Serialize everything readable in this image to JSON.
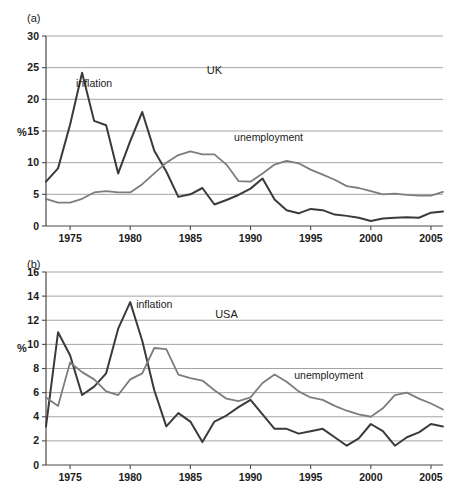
{
  "figure": {
    "panel_a_label": "(a)",
    "panel_b_label": "(b)",
    "axis_label": "%"
  },
  "chart_data": [
    {
      "id": "uk",
      "type": "line",
      "title": "UK",
      "panel": "(a)",
      "xlabel": "",
      "ylabel": "%",
      "xlim": [
        1973,
        2006
      ],
      "ylim": [
        0,
        30
      ],
      "yticks": [
        0,
        5,
        10,
        15,
        20,
        25,
        30
      ],
      "xticks": [
        1975,
        1980,
        1985,
        1990,
        1995,
        2000,
        2005
      ],
      "xticklabels": [
        "1975",
        "1980",
        "1985",
        "1990",
        "1995",
        "2000",
        "2005"
      ],
      "yticklabels": [
        "0",
        "5",
        "10",
        "15",
        "20",
        "25",
        "30"
      ],
      "grid": true,
      "legend": "inline-annotations",
      "annotations": [
        {
          "text": "inflation",
          "x": 1977.0,
          "y": 22.0
        },
        {
          "text": "UK",
          "x": 1987.0,
          "y": 24.0
        },
        {
          "text": "unemployment",
          "x": 1991.5,
          "y": 13.5
        }
      ],
      "x": [
        1973,
        1974,
        1975,
        1976,
        1977,
        1978,
        1979,
        1980,
        1981,
        1982,
        1983,
        1984,
        1985,
        1986,
        1987,
        1988,
        1989,
        1990,
        1991,
        1992,
        1993,
        1994,
        1995,
        1996,
        1997,
        1998,
        1999,
        2000,
        2001,
        2002,
        2003,
        2004,
        2005,
        2006
      ],
      "series": [
        {
          "name": "inflation",
          "color": "#3a3a3a",
          "values": [
            7.0,
            9.1,
            16.0,
            24.2,
            16.6,
            15.9,
            8.3,
            13.4,
            18.0,
            11.9,
            8.6,
            4.6,
            5.0,
            6.0,
            3.4,
            4.1,
            4.9,
            5.9,
            7.5,
            4.2,
            2.5,
            2.0,
            2.7,
            2.5,
            1.8,
            1.6,
            1.3,
            0.8,
            1.2,
            1.3,
            1.4,
            1.3,
            2.1,
            2.3
          ]
        },
        {
          "name": "unemployment",
          "color": "#7d7d7d",
          "values": [
            4.3,
            3.7,
            3.7,
            4.3,
            5.3,
            5.5,
            5.3,
            5.3,
            6.6,
            8.3,
            10.0,
            11.2,
            11.8,
            11.3,
            11.3,
            9.7,
            7.1,
            7.0,
            8.3,
            9.7,
            10.3,
            9.9,
            8.9,
            8.1,
            7.3,
            6.3,
            6.0,
            5.5,
            5.0,
            5.1,
            4.9,
            4.8,
            4.8,
            5.4
          ]
        }
      ]
    },
    {
      "id": "usa",
      "type": "line",
      "title": "USA",
      "panel": "(b)",
      "xlabel": "",
      "ylabel": "%",
      "xlim": [
        1973,
        2006
      ],
      "ylim": [
        0,
        16
      ],
      "yticks": [
        0,
        2,
        4,
        6,
        8,
        10,
        12,
        14,
        16
      ],
      "xticks": [
        1975,
        1980,
        1985,
        1990,
        1995,
        2000,
        2005
      ],
      "xticklabels": [
        "1975",
        "1980",
        "1985",
        "1990",
        "1995",
        "2000",
        "2005"
      ],
      "yticklabels": [
        "0",
        "2",
        "4",
        "6",
        "8",
        "10",
        "12",
        "14",
        "16"
      ],
      "grid": true,
      "legend": "inline-annotations",
      "annotations": [
        {
          "text": "inflation",
          "x": 1982.0,
          "y": 13.0
        },
        {
          "text": "USA",
          "x": 1988.0,
          "y": 12.2
        },
        {
          "text": "unemployment",
          "x": 1996.5,
          "y": 7.1
        }
      ],
      "x": [
        1973,
        1974,
        1975,
        1976,
        1977,
        1978,
        1979,
        1980,
        1981,
        1982,
        1983,
        1984,
        1985,
        1986,
        1987,
        1988,
        1989,
        1990,
        1991,
        1992,
        1993,
        1994,
        1995,
        1996,
        1997,
        1998,
        1999,
        2000,
        2001,
        2002,
        2003,
        2004,
        2005,
        2006
      ],
      "series": [
        {
          "name": "inflation",
          "color": "#3a3a3a",
          "values": [
            3.2,
            11.0,
            9.1,
            5.8,
            6.5,
            7.6,
            11.3,
            13.5,
            10.3,
            6.2,
            3.2,
            4.3,
            3.6,
            1.9,
            3.6,
            4.1,
            4.8,
            5.4,
            4.2,
            3.0,
            3.0,
            2.6,
            2.8,
            3.0,
            2.3,
            1.6,
            2.2,
            3.4,
            2.8,
            1.6,
            2.3,
            2.7,
            3.4,
            3.2
          ]
        },
        {
          "name": "unemployment",
          "color": "#7d7d7d",
          "values": [
            5.6,
            4.9,
            8.5,
            7.7,
            7.1,
            6.1,
            5.8,
            7.1,
            7.6,
            9.7,
            9.6,
            7.5,
            7.2,
            7.0,
            6.2,
            5.5,
            5.3,
            5.6,
            6.8,
            7.5,
            6.9,
            6.1,
            5.6,
            5.4,
            4.9,
            4.5,
            4.2,
            4.0,
            4.7,
            5.8,
            6.0,
            5.5,
            5.1,
            4.6
          ]
        }
      ]
    }
  ]
}
